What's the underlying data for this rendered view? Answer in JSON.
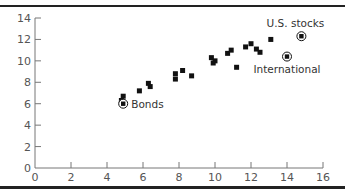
{
  "chart_data": {
    "type": "scatter",
    "title": "",
    "xlabel": "",
    "ylabel": "",
    "xlim": [
      0,
      16
    ],
    "ylim": [
      0,
      14
    ],
    "x_ticks": [
      0,
      2,
      4,
      6,
      8,
      10,
      12,
      14,
      16
    ],
    "y_ticks": [
      0,
      2,
      4,
      6,
      8,
      10,
      12,
      14
    ],
    "grid": false,
    "legend": null,
    "points": [
      {
        "x": 4.8,
        "y": 6.3
      },
      {
        "x": 4.9,
        "y": 6.7
      },
      {
        "x": 5.8,
        "y": 7.2
      },
      {
        "x": 6.3,
        "y": 7.9
      },
      {
        "x": 6.4,
        "y": 7.6
      },
      {
        "x": 7.8,
        "y": 8.3
      },
      {
        "x": 7.8,
        "y": 8.8
      },
      {
        "x": 8.2,
        "y": 9.1
      },
      {
        "x": 8.7,
        "y": 8.6
      },
      {
        "x": 9.8,
        "y": 10.3
      },
      {
        "x": 10.0,
        "y": 10.0
      },
      {
        "x": 9.9,
        "y": 9.8
      },
      {
        "x": 10.7,
        "y": 10.7
      },
      {
        "x": 10.9,
        "y": 11.0
      },
      {
        "x": 11.2,
        "y": 9.4
      },
      {
        "x": 11.7,
        "y": 11.3
      },
      {
        "x": 12.0,
        "y": 11.6
      },
      {
        "x": 12.3,
        "y": 11.1
      },
      {
        "x": 12.5,
        "y": 10.8
      },
      {
        "x": 13.1,
        "y": 12.0
      }
    ],
    "highlighted_points": [
      {
        "label": "Bonds",
        "x": 4.9,
        "y": 6.0,
        "label_pos": "right"
      },
      {
        "label": "International",
        "x": 14.0,
        "y": 10.4,
        "label_pos": "below"
      },
      {
        "label": "U.S. stocks",
        "x": 14.8,
        "y": 12.3,
        "label_pos": "above"
      }
    ]
  },
  "colors": {
    "marker": "#111111",
    "axis": "#777777",
    "rule": "#222222",
    "text": "#444444"
  }
}
